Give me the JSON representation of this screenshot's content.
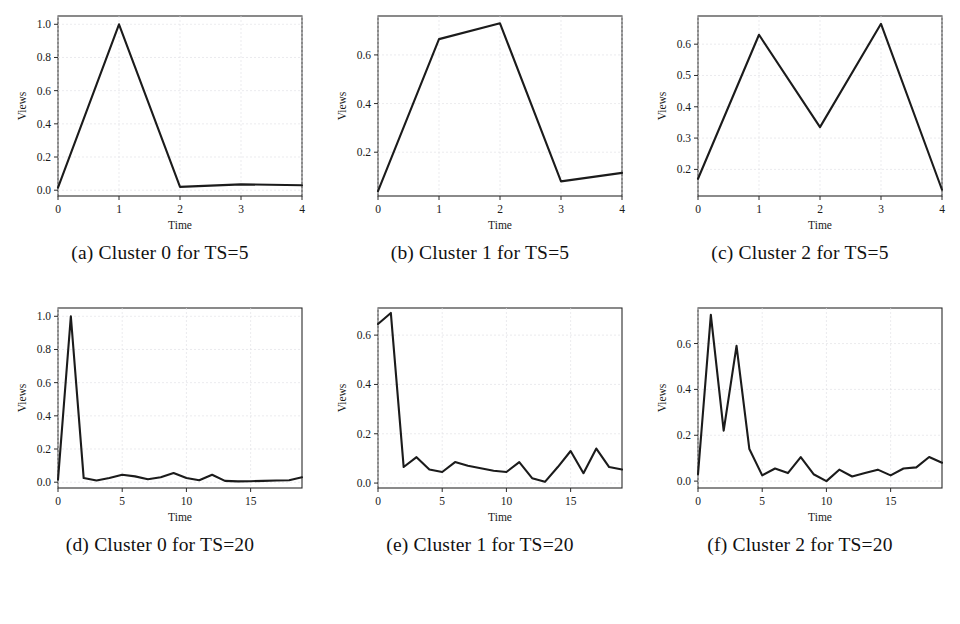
{
  "figure": {
    "background_color": "#ffffff",
    "line_color": "#1b1b1b",
    "frame_color": "#2b2b2b",
    "grid_color": "#e2e2e6",
    "rows": 2,
    "columns": 3
  },
  "panels": [
    {
      "id": "panel-a",
      "caption": "(a) Cluster 0 for TS=5",
      "xlabel": "Time",
      "ylabel": "Views"
    },
    {
      "id": "panel-b",
      "caption": "(b) Cluster 1 for TS=5",
      "xlabel": "Time",
      "ylabel": "Views"
    },
    {
      "id": "panel-c",
      "caption": "(c) Cluster 2 for TS=5",
      "xlabel": "Time",
      "ylabel": "Views"
    },
    {
      "id": "panel-d",
      "caption": "(d) Cluster 0 for TS=20",
      "xlabel": "Time",
      "ylabel": "Views"
    },
    {
      "id": "panel-e",
      "caption": "(e) Cluster 1 for TS=20",
      "xlabel": "Time",
      "ylabel": "Views"
    },
    {
      "id": "panel-f",
      "caption": "(f) Cluster 2 for TS=20",
      "xlabel": "Time",
      "ylabel": "Views"
    }
  ],
  "chart_data": [
    {
      "type": "line",
      "title": "(a) Cluster 0 for TS=5",
      "xlabel": "Time",
      "ylabel": "Views",
      "x": [
        0,
        1,
        2,
        3,
        4
      ],
      "values": [
        0.015,
        1.0,
        0.02,
        0.035,
        0.03
      ],
      "xlim": [
        0,
        4
      ],
      "ylim": [
        -0.035,
        1.05
      ],
      "xticks": [
        0,
        1,
        2,
        3,
        4
      ],
      "xticklabels": [
        "0",
        "1",
        "2",
        "3",
        "4"
      ],
      "yticks": [
        0.0,
        0.2,
        0.4,
        0.6,
        0.8,
        1.0
      ],
      "yticklabels": [
        "0.0",
        "0.2",
        "0.4",
        "0.6",
        "0.8",
        "1.0"
      ],
      "grid": true,
      "legend": null
    },
    {
      "type": "line",
      "title": "(b) Cluster 1 for TS=5",
      "xlabel": "Time",
      "ylabel": "Views",
      "x": [
        0,
        1,
        2,
        3,
        4
      ],
      "values": [
        0.04,
        0.665,
        0.73,
        0.08,
        0.115
      ],
      "xlim": [
        0,
        4
      ],
      "ylim": [
        0.02,
        0.76
      ],
      "xticks": [
        0,
        1,
        2,
        3,
        4
      ],
      "xticklabels": [
        "0",
        "1",
        "2",
        "3",
        "4"
      ],
      "yticks": [
        0.2,
        0.4,
        0.6
      ],
      "yticklabels": [
        "0.2",
        "0.4",
        "0.6"
      ],
      "grid": true,
      "legend": null
    },
    {
      "type": "line",
      "title": "(c) Cluster 2 for TS=5",
      "xlabel": "Time",
      "ylabel": "Views",
      "x": [
        0,
        1,
        2,
        3,
        4
      ],
      "values": [
        0.17,
        0.63,
        0.335,
        0.665,
        0.135
      ],
      "xlim": [
        0,
        4
      ],
      "ylim": [
        0.115,
        0.69
      ],
      "xticks": [
        0,
        1,
        2,
        3,
        4
      ],
      "xticklabels": [
        "0",
        "1",
        "2",
        "3",
        "4"
      ],
      "yticks": [
        0.2,
        0.3,
        0.4,
        0.5,
        0.6
      ],
      "yticklabels": [
        "0.2",
        "0.3",
        "0.4",
        "0.5",
        "0.6"
      ],
      "grid": true,
      "legend": null
    },
    {
      "type": "line",
      "title": "(d) Cluster 0 for TS=20",
      "xlabel": "Time",
      "ylabel": "Views",
      "x": [
        0,
        1,
        2,
        3,
        4,
        5,
        6,
        7,
        8,
        9,
        10,
        11,
        12,
        13,
        14,
        15,
        16,
        17,
        18,
        19
      ],
      "values": [
        0.015,
        1.0,
        0.025,
        0.01,
        0.025,
        0.045,
        0.035,
        0.018,
        0.03,
        0.055,
        0.025,
        0.012,
        0.045,
        0.008,
        0.005,
        0.006,
        0.008,
        0.01,
        0.012,
        0.03
      ],
      "xlim": [
        0,
        19
      ],
      "ylim": [
        -0.035,
        1.05
      ],
      "xticks": [
        0,
        5,
        10,
        15
      ],
      "xticklabels": [
        "0",
        "5",
        "10",
        "15"
      ],
      "yticks": [
        0.0,
        0.2,
        0.4,
        0.6,
        0.8,
        1.0
      ],
      "yticklabels": [
        "0.0",
        "0.2",
        "0.4",
        "0.6",
        "0.8",
        "1.0"
      ],
      "grid": true,
      "legend": null
    },
    {
      "type": "line",
      "title": "(e) Cluster 1 for TS=20",
      "xlabel": "Time",
      "ylabel": "Views",
      "x": [
        0,
        1,
        2,
        3,
        4,
        5,
        6,
        7,
        8,
        9,
        10,
        11,
        12,
        13,
        14,
        15,
        16,
        17,
        18,
        19
      ],
      "values": [
        0.645,
        0.69,
        0.065,
        0.105,
        0.055,
        0.045,
        0.085,
        0.07,
        0.06,
        0.05,
        0.045,
        0.085,
        0.02,
        0.005,
        0.065,
        0.13,
        0.04,
        0.14,
        0.065,
        0.055
      ],
      "xlim": [
        0,
        19
      ],
      "ylim": [
        -0.02,
        0.71
      ],
      "xticks": [
        0,
        5,
        10,
        15
      ],
      "xticklabels": [
        "0",
        "5",
        "10",
        "15"
      ],
      "yticks": [
        0.0,
        0.2,
        0.4,
        0.6
      ],
      "yticklabels": [
        "0.0",
        "0.2",
        "0.4",
        "0.6"
      ],
      "grid": true,
      "legend": null
    },
    {
      "type": "line",
      "title": "(f) Cluster 2 for TS=20",
      "xlabel": "Time",
      "ylabel": "Views",
      "x": [
        0,
        1,
        2,
        3,
        4,
        5,
        6,
        7,
        8,
        9,
        10,
        11,
        12,
        13,
        14,
        15,
        16,
        17,
        18,
        19
      ],
      "values": [
        0.03,
        0.725,
        0.22,
        0.59,
        0.14,
        0.025,
        0.055,
        0.035,
        0.105,
        0.03,
        0.0,
        0.05,
        0.02,
        0.035,
        0.05,
        0.025,
        0.055,
        0.06,
        0.105,
        0.08
      ],
      "xlim": [
        0,
        19
      ],
      "ylim": [
        -0.03,
        0.755
      ],
      "xticks": [
        0,
        5,
        10,
        15
      ],
      "xticklabels": [
        "0",
        "5",
        "10",
        "15"
      ],
      "yticks": [
        0.0,
        0.2,
        0.4,
        0.6
      ],
      "yticklabels": [
        "0.0",
        "0.2",
        "0.4",
        "0.6"
      ],
      "grid": true,
      "legend": null
    }
  ]
}
